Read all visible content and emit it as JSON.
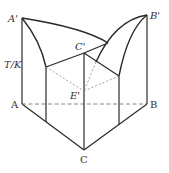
{
  "diagram": {
    "type": "ternary phase diagram (3D prism, eutectic system)",
    "axis_label": "T/K",
    "points": {
      "A_top": "A'",
      "B_top": "B'",
      "C_top": "C'",
      "E_top": "E'",
      "A": "A",
      "B": "B",
      "C": "C"
    },
    "colors": {
      "line": "#2a2a2a",
      "dashed": "#777777",
      "background": "#ffffff"
    }
  }
}
